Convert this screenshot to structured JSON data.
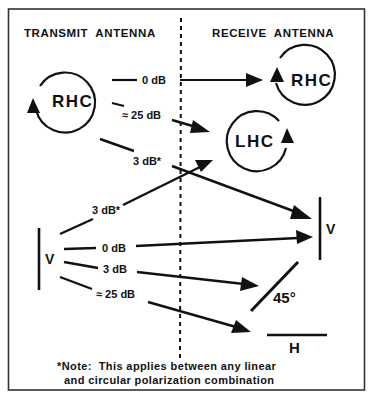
{
  "headers": {
    "transmit": "TRANSMIT  ANTENNA",
    "receive": "RECEIVE  ANTENNA"
  },
  "transmit_antennas": {
    "rhc": "RHC",
    "v": "V"
  },
  "receive_antennas": {
    "rhc": "RHC",
    "lhc": "LHC",
    "v": "V",
    "angle": "45°",
    "h": "H"
  },
  "links": {
    "rhc_to_rhc": "0 dB",
    "rhc_to_lhc": "≈ 25 dB",
    "rhc_to_v": "3 dB*",
    "v_to_lhc": "3 dB*",
    "v_to_v": "0 dB",
    "v_to_45": "3 dB",
    "v_to_h": "≈ 25 dB"
  },
  "note": {
    "line1": "*Note:  This applies between any linear",
    "line2": "and circular polarization combination"
  },
  "colors": {
    "ink": "#111111",
    "frame": "#333333",
    "background": "#ffffff"
  }
}
